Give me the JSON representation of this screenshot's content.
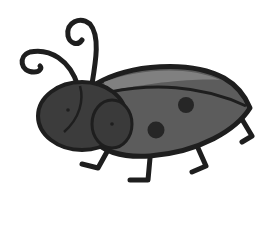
{
  "image": {
    "subject": "ladybug clipart",
    "background": "#ffffff",
    "colors": {
      "outline": "#1e1e1e",
      "head": "#3c3c3c",
      "body": "#5c5c5c",
      "highlight": "#808080",
      "spots": "#262626"
    },
    "spot_count": 2,
    "leg_count": 4,
    "antenna_count": 2
  }
}
